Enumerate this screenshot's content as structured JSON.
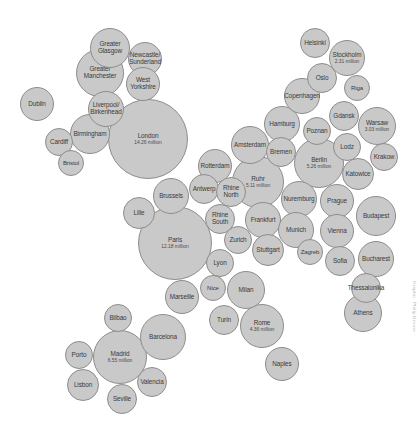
{
  "figure": {
    "credit": "Graphic: Philip Brewer",
    "background_color": "#ffffff",
    "bubble_fill": "#c9c9c9",
    "bubble_stroke": "#8d8d8d",
    "label_color": "#3a3a3a"
  },
  "chart_data": {
    "type": "scatter",
    "xlabel": "",
    "ylabel": "",
    "units": "million",
    "encoding": "circle area proportional to population",
    "legend": "none",
    "grid": false,
    "axes_visible": false,
    "points": [
      {
        "name": "Greater\nGlasgow",
        "label": "Greater\nGlasgow",
        "population": null,
        "population_text": "",
        "cx": 110,
        "cy": 48,
        "r": 20
      },
      {
        "name": "Greater\nManchester",
        "label": "Greater\nManchester",
        "population": null,
        "population_text": "",
        "cx": 100,
        "cy": 73,
        "r": 24
      },
      {
        "name": "Newcastle/\nSunderland",
        "label": "Newcastle/\nSunderland",
        "population": null,
        "population_text": "",
        "cx": 145,
        "cy": 59,
        "r": 17
      },
      {
        "name": "West\nYorkshire",
        "label": "West\nYorkshire",
        "population": null,
        "population_text": "",
        "cx": 143,
        "cy": 84,
        "r": 17
      },
      {
        "name": "Dublin",
        "label": "Dublin",
        "population": null,
        "population_text": "",
        "cx": 37,
        "cy": 104,
        "r": 17
      },
      {
        "name": "Liverpool/\nBirkenhead",
        "label": "Liverpool/\nBirkenhead",
        "population": null,
        "population_text": "",
        "cx": 106,
        "cy": 109,
        "r": 18
      },
      {
        "name": "Birmingham",
        "label": "Birmingham",
        "population": null,
        "population_text": "",
        "cx": 90,
        "cy": 134,
        "r": 20
      },
      {
        "name": "Cardiff",
        "label": "Cardiff",
        "population": null,
        "population_text": "",
        "cx": 59,
        "cy": 142,
        "r": 14
      },
      {
        "name": "Bristol",
        "label": "Bristol",
        "population": null,
        "population_text": "",
        "cx": 71,
        "cy": 163,
        "r": 13
      },
      {
        "name": "London",
        "label": "London",
        "population": 14.26,
        "population_text": "14.26 million",
        "cx": 148,
        "cy": 139,
        "r": 40
      },
      {
        "name": "Lille",
        "label": "Lille",
        "population": null,
        "population_text": "",
        "cx": 139,
        "cy": 213,
        "r": 16
      },
      {
        "name": "Brussels",
        "label": "Brussels",
        "population": null,
        "population_text": "",
        "cx": 171,
        "cy": 196,
        "r": 18
      },
      {
        "name": "Antwerp",
        "label": "Antwerp",
        "population": null,
        "population_text": "",
        "cx": 204,
        "cy": 189,
        "r": 15
      },
      {
        "name": "Rotterdam",
        "label": "Rotterdam",
        "population": null,
        "population_text": "",
        "cx": 215,
        "cy": 166,
        "r": 17
      },
      {
        "name": "Amsterdam",
        "label": "Amsterdam",
        "population": null,
        "population_text": "",
        "cx": 250,
        "cy": 145,
        "r": 19
      },
      {
        "name": "Paris",
        "label": "Paris",
        "population": 12.18,
        "population_text": "12.18 million",
        "cx": 175,
        "cy": 243,
        "r": 37
      },
      {
        "name": "Rhine\nNorth",
        "label": "Rhine\nNorth",
        "population": null,
        "population_text": "",
        "cx": 231,
        "cy": 192,
        "r": 15
      },
      {
        "name": "Rhine\nSouth",
        "label": "Rhine\nSouth",
        "population": null,
        "population_text": "",
        "cx": 220,
        "cy": 219,
        "r": 15
      },
      {
        "name": "Ruhr",
        "label": "Ruhr",
        "population": 5.11,
        "population_text": "5.11 million",
        "cx": 258,
        "cy": 182,
        "r": 26
      },
      {
        "name": "Frankfurt",
        "label": "Frankfurt",
        "population": null,
        "population_text": "",
        "cx": 263,
        "cy": 220,
        "r": 18
      },
      {
        "name": "Zurich",
        "label": "Zurich",
        "population": null,
        "population_text": "",
        "cx": 238,
        "cy": 240,
        "r": 14
      },
      {
        "name": "Stuttgart",
        "label": "Stuttgart",
        "population": null,
        "population_text": "",
        "cx": 268,
        "cy": 250,
        "r": 16
      },
      {
        "name": "Bremen",
        "label": "Bremen",
        "population": null,
        "population_text": "",
        "cx": 281,
        "cy": 152,
        "r": 15
      },
      {
        "name": "Hamburg",
        "label": "Hamburg",
        "population": null,
        "population_text": "",
        "cx": 282,
        "cy": 124,
        "r": 18
      },
      {
        "name": "Berlin",
        "label": "Berlin",
        "population": 5.26,
        "population_text": "5.26 million",
        "cx": 319,
        "cy": 163,
        "r": 25
      },
      {
        "name": "Nuremburg",
        "label": "Nuremburg",
        "population": null,
        "population_text": "",
        "cx": 299,
        "cy": 199,
        "r": 18
      },
      {
        "name": "Munich",
        "label": "Munich",
        "population": null,
        "population_text": "",
        "cx": 296,
        "cy": 230,
        "r": 18
      },
      {
        "name": "Helsinki",
        "label": "Helsinki",
        "population": null,
        "population_text": "",
        "cx": 315,
        "cy": 43,
        "r": 15
      },
      {
        "name": "Stockholm",
        "label": "Stockholm",
        "population": 2.31,
        "population_text": "2.31 million",
        "cx": 347,
        "cy": 58,
        "r": 18
      },
      {
        "name": "Oslo",
        "label": "Oslo",
        "population": null,
        "population_text": "",
        "cx": 322,
        "cy": 78,
        "r": 15
      },
      {
        "name": "Riga",
        "label": "Riga",
        "population": null,
        "population_text": "",
        "cx": 357,
        "cy": 88,
        "r": 13
      },
      {
        "name": "Copenhagen",
        "label": "Copenhagen",
        "population": null,
        "population_text": "",
        "cx": 302,
        "cy": 96,
        "r": 18
      },
      {
        "name": "Gdansk",
        "label": "Gdansk",
        "population": null,
        "population_text": "",
        "cx": 344,
        "cy": 116,
        "r": 15
      },
      {
        "name": "Poznan",
        "label": "Poznan",
        "population": null,
        "population_text": "",
        "cx": 317,
        "cy": 131,
        "r": 14
      },
      {
        "name": "Warsaw",
        "label": "Warsaw",
        "population": 3.03,
        "population_text": "3.03 million",
        "cx": 377,
        "cy": 126,
        "r": 19
      },
      {
        "name": "Lodz",
        "label": "Lodz",
        "population": null,
        "population_text": "",
        "cx": 347,
        "cy": 147,
        "r": 14
      },
      {
        "name": "Krakow",
        "label": "Krakow",
        "population": null,
        "population_text": "",
        "cx": 384,
        "cy": 157,
        "r": 14
      },
      {
        "name": "Katowice",
        "label": "Katowice",
        "population": null,
        "population_text": "",
        "cx": 358,
        "cy": 174,
        "r": 16
      },
      {
        "name": "Prague",
        "label": "Prague",
        "population": null,
        "population_text": "",
        "cx": 337,
        "cy": 201,
        "r": 17
      },
      {
        "name": "Budapest",
        "label": "Budapest",
        "population": null,
        "population_text": "",
        "cx": 376,
        "cy": 216,
        "r": 20
      },
      {
        "name": "Vienna",
        "label": "Vienna",
        "population": null,
        "population_text": "",
        "cx": 337,
        "cy": 231,
        "r": 17
      },
      {
        "name": "Zagreb",
        "label": "Zagreb",
        "population": null,
        "population_text": "",
        "cx": 310,
        "cy": 252,
        "r": 13
      },
      {
        "name": "Sofia",
        "label": "Sofia",
        "population": null,
        "population_text": "",
        "cx": 340,
        "cy": 261,
        "r": 15
      },
      {
        "name": "Bucharest",
        "label": "Bucharest",
        "population": null,
        "population_text": "",
        "cx": 376,
        "cy": 259,
        "r": 18
      },
      {
        "name": "Thessalonika",
        "label": "Thessalonika",
        "population": null,
        "population_text": "",
        "cx": 366,
        "cy": 288,
        "r": 15
      },
      {
        "name": "Athens",
        "label": "Athens",
        "population": null,
        "population_text": "",
        "cx": 363,
        "cy": 313,
        "r": 19
      },
      {
        "name": "Lyon",
        "label": "Lyon",
        "population": null,
        "population_text": "",
        "cx": 220,
        "cy": 263,
        "r": 14
      },
      {
        "name": "Nice",
        "label": "Nice",
        "population": null,
        "population_text": "",
        "cx": 213,
        "cy": 288,
        "r": 13
      },
      {
        "name": "Marseille",
        "label": "Marseille",
        "population": null,
        "population_text": "",
        "cx": 182,
        "cy": 297,
        "r": 17
      },
      {
        "name": "Turin",
        "label": "Turin",
        "population": null,
        "population_text": "",
        "cx": 224,
        "cy": 320,
        "r": 15
      },
      {
        "name": "Milan",
        "label": "Milan",
        "population": null,
        "population_text": "",
        "cx": 246,
        "cy": 290,
        "r": 19
      },
      {
        "name": "Rome",
        "label": "Rome",
        "population": 4.36,
        "population_text": "4.36 million",
        "cx": 262,
        "cy": 326,
        "r": 22
      },
      {
        "name": "Naples",
        "label": "Naples",
        "population": null,
        "population_text": "",
        "cx": 282,
        "cy": 364,
        "r": 17
      },
      {
        "name": "Bilbao",
        "label": "Bilbao",
        "population": null,
        "population_text": "",
        "cx": 118,
        "cy": 318,
        "r": 14
      },
      {
        "name": "Barcelona",
        "label": "Barcelona",
        "population": null,
        "population_text": "",
        "cx": 163,
        "cy": 337,
        "r": 23
      },
      {
        "name": "Madrid",
        "label": "Madrid",
        "population": 6.55,
        "population_text": "6.55 million",
        "cx": 120,
        "cy": 357,
        "r": 27
      },
      {
        "name": "Porto",
        "label": "Porto",
        "population": null,
        "population_text": "",
        "cx": 79,
        "cy": 355,
        "r": 14
      },
      {
        "name": "Lisbon",
        "label": "Lisbon",
        "population": null,
        "population_text": "",
        "cx": 83,
        "cy": 385,
        "r": 16
      },
      {
        "name": "Seville",
        "label": "Seville",
        "population": null,
        "population_text": "",
        "cx": 122,
        "cy": 399,
        "r": 15
      },
      {
        "name": "Valencia",
        "label": "Valencia",
        "population": null,
        "population_text": "",
        "cx": 152,
        "cy": 382,
        "r": 15
      }
    ]
  }
}
